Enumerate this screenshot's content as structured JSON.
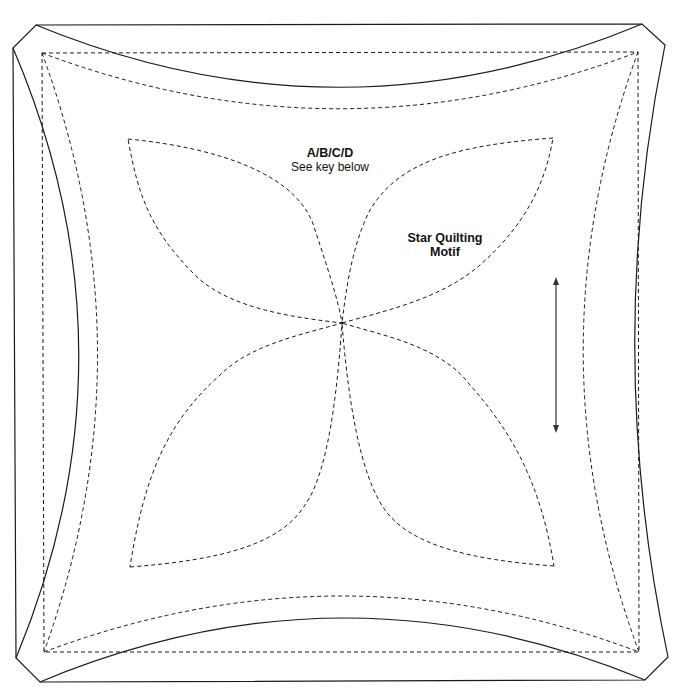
{
  "diagram": {
    "colors": {
      "line": "#1a1a1a",
      "background": "#ffffff"
    },
    "labels": {
      "key_title": "A/B/C/D",
      "key_subtitle": "See key below",
      "motif_line1": "Star Quilting",
      "motif_line2": "Motif"
    },
    "annotations": {
      "grainline_arrow": "double-headed vertical arrow (grain line)"
    }
  }
}
